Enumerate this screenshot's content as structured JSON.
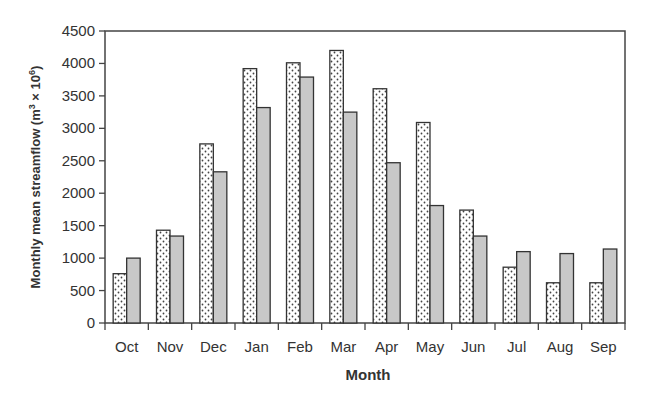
{
  "chart_data": {
    "type": "bar",
    "title": "",
    "xlabel": "Month",
    "ylabel": "Monthly mean streamflow (m³ × 10⁶)",
    "ylabel_parts": {
      "main": "Monthly mean streamflow (m",
      "sup1": "3",
      "mid": " × 10",
      "sup2": "6",
      "end": ")"
    },
    "ylim": [
      0,
      4500
    ],
    "yticks": [
      0,
      500,
      1000,
      1500,
      2000,
      2500,
      3000,
      3500,
      4000,
      4500
    ],
    "grid": false,
    "legend": "none",
    "categories": [
      "Oct",
      "Nov",
      "Dec",
      "Jan",
      "Feb",
      "Mar",
      "Apr",
      "May",
      "Jun",
      "Jul",
      "Aug",
      "Sep"
    ],
    "series": [
      {
        "name": "Series 1 (dotted)",
        "pattern": "dotted",
        "values": [
          760,
          1430,
          2760,
          3920,
          4010,
          4200,
          3610,
          3090,
          1740,
          860,
          620,
          620
        ]
      },
      {
        "name": "Series 2 (gray)",
        "pattern": "solid-gray",
        "color": "#c8c8c8",
        "values": [
          1000,
          1340,
          2330,
          3320,
          3790,
          3250,
          2470,
          1810,
          1340,
          1100,
          1070,
          1140
        ]
      }
    ]
  }
}
